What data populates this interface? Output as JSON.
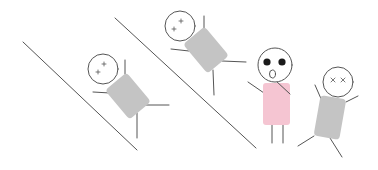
{
  "scene": {
    "description": "Stick figures sliding down two slopes while a surprised pink figure watches",
    "background": "#ffffff",
    "line_color": "#555555",
    "body_gray": "#c4c4c4",
    "body_pink": "#f5c5d2",
    "slopes": [
      {
        "x1": 23,
        "y1": 42,
        "x2": 137,
        "y2": 150
      },
      {
        "x1": 115,
        "y1": 18,
        "x2": 256,
        "y2": 148
      }
    ],
    "figures": [
      {
        "name": "sliding-figure-lower",
        "expression": "dizzy"
      },
      {
        "name": "sliding-figure-upper",
        "expression": "dizzy"
      },
      {
        "name": "surprised-pink-figure",
        "expression": "surprised"
      },
      {
        "name": "waving-figure-right",
        "expression": "dizzy"
      }
    ]
  }
}
